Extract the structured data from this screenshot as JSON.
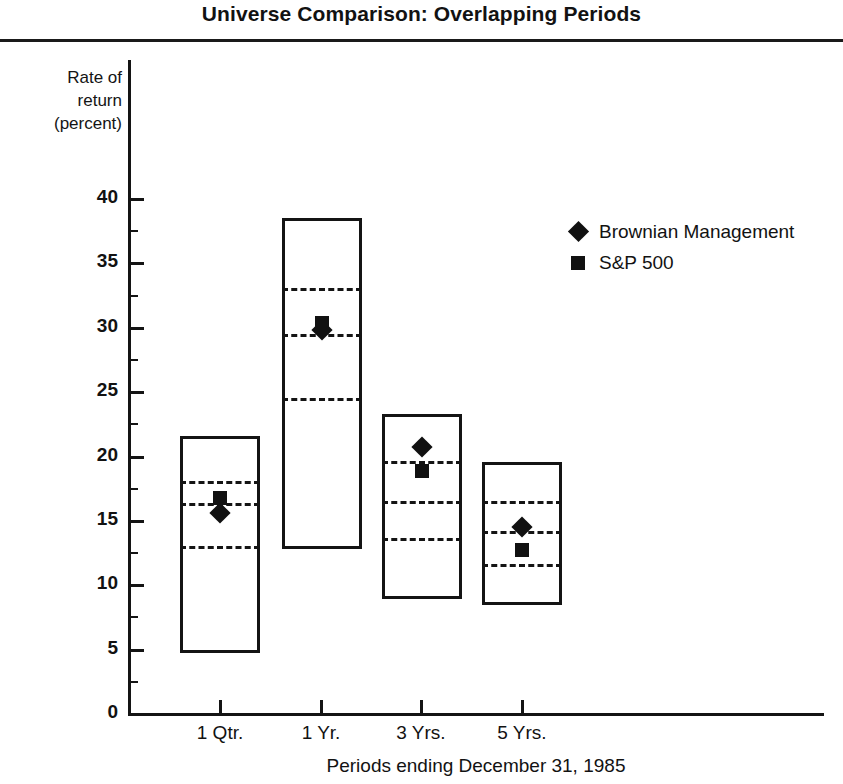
{
  "chart_data": {
    "type": "bar",
    "title": "Universe Comparison: Overlapping Periods",
    "xlabel": "Periods ending December 31, 1985",
    "ylabel": "Rate of return (percent)",
    "ylabel_lines": [
      "Rate of",
      "return",
      "(percent)"
    ],
    "ylim": [
      0,
      42
    ],
    "ytick_values": [
      0,
      5,
      10,
      15,
      20,
      25,
      30,
      35,
      40
    ],
    "ytick_labels": [
      "0",
      "5",
      "10",
      "15",
      "20",
      "25",
      "30",
      "35",
      "40"
    ],
    "yminor_values": [
      2.5,
      7.5,
      12.5,
      17.5,
      22.5,
      27.5,
      32.5,
      37.5
    ],
    "grid": false,
    "categories": [
      "1 Qtr.",
      "1 Yr.",
      "3 Yrs.",
      "5 Yrs."
    ],
    "legend_position": "upper right",
    "legend": [
      {
        "name": "Brownian Management",
        "marker": "diamond"
      },
      {
        "name": "S&P 500",
        "marker": "square"
      }
    ],
    "boxes": [
      {
        "category": "1 Qtr.",
        "high": 21.6,
        "upper_quartile": 18.0,
        "median": 16.3,
        "lower_quartile": 13.0,
        "low": 4.7
      },
      {
        "category": "1 Yr.",
        "high": 38.5,
        "upper_quartile": 33.0,
        "median": 29.4,
        "lower_quartile": 24.5,
        "low": 12.8
      },
      {
        "category": "3 Yrs.",
        "high": 23.3,
        "upper_quartile": 19.6,
        "median": 16.5,
        "lower_quartile": 13.6,
        "low": 8.9
      },
      {
        "category": "5 Yrs.",
        "high": 19.6,
        "upper_quartile": 16.5,
        "median": 14.1,
        "lower_quartile": 11.6,
        "low": 8.5
      }
    ],
    "series": [
      {
        "name": "Brownian Management",
        "marker": "diamond",
        "values": [
          15.6,
          29.8,
          20.7,
          14.5
        ]
      },
      {
        "name": "S&P 500",
        "marker": "square",
        "values": [
          16.8,
          30.4,
          18.9,
          12.7
        ]
      }
    ]
  },
  "geometry": {
    "y_zero_px": 714,
    "px_per_unit": 12.875,
    "box_left_px": [
      180,
      282,
      382,
      482
    ],
    "box_width_px": 80,
    "tick_x_px": [
      220,
      321,
      421,
      522
    ]
  }
}
